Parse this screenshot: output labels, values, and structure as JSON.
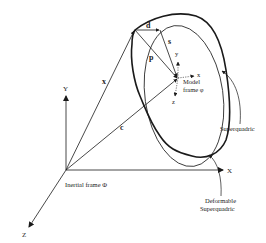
{
  "diagram": {
    "inertial_frame": {
      "label": "Inertial frame Φ",
      "axes": {
        "x": "X",
        "y": "Y",
        "z": "Z"
      }
    },
    "model_frame": {
      "label_line1": "Model",
      "label_line2": "frame φ",
      "axes": {
        "x": "x",
        "y": "y",
        "z": "z"
      }
    },
    "vectors": {
      "x": "x",
      "c": "c",
      "p": "p",
      "s": "s",
      "d": "d"
    },
    "callouts": {
      "superquadric": "Superquadric",
      "deformable_line1": "Deformable",
      "deformable_line2": "Superquadric"
    }
  }
}
